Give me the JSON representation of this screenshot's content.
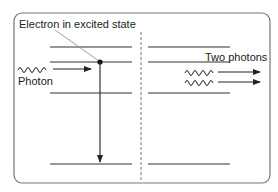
{
  "diagram": {
    "labels": {
      "electron": "Electron in excited state",
      "photon_in": "Photon",
      "photons_out": "Two photons"
    },
    "left_panel": {
      "energy_levels_y": [
        47,
        62,
        93,
        164
      ],
      "excited_level_index": 1,
      "electron_x": 100,
      "transition": {
        "from_level": 1,
        "to_level": 3
      }
    },
    "right_panel": {
      "energy_levels_y": [
        47,
        62,
        93,
        164
      ],
      "emitted_photons": 2
    },
    "colors": {
      "line": "#333333",
      "frame": "#777777",
      "divider": "#777777",
      "text": "#222222",
      "leader": "#888888"
    }
  }
}
